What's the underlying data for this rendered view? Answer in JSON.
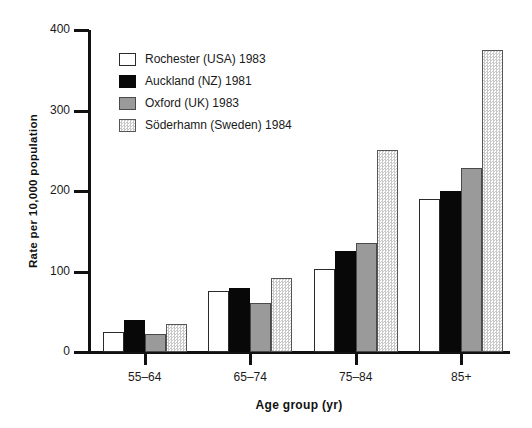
{
  "chart_data": {
    "type": "bar",
    "title": "",
    "xlabel": "Age group (yr)",
    "ylabel": "Rate per 10,000 population",
    "categories": [
      "55–64",
      "65–74",
      "75–84",
      "85+"
    ],
    "ylim": [
      0,
      400
    ],
    "yticks": [
      0,
      100,
      200,
      300,
      400
    ],
    "ytick_labels": [
      "0",
      "100",
      "200",
      "300",
      "400"
    ],
    "grid": false,
    "legend_position": "upper-left-inside",
    "series": [
      {
        "name": "Rochester (USA) 1983",
        "swatch": "white",
        "color": "#ffffff",
        "values": [
          25,
          76,
          103,
          190
        ]
      },
      {
        "name": "Auckland (NZ) 1981",
        "swatch": "black",
        "color": "#080808",
        "values": [
          40,
          80,
          126,
          200
        ]
      },
      {
        "name": "Oxford (UK) 1983",
        "swatch": "gray",
        "color": "#9a9a9a",
        "values": [
          23,
          61,
          136,
          228
        ]
      },
      {
        "name": "Söderhamn (Sweden) 1984",
        "swatch": "dither",
        "color": "#d8d8d8",
        "values": [
          35,
          92,
          251,
          375
        ]
      }
    ]
  }
}
